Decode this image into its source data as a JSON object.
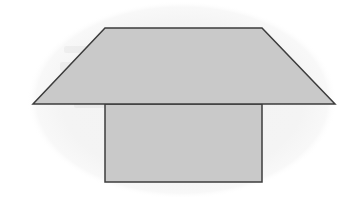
{
  "image": {
    "width": 353,
    "height": 197,
    "background_color": "#ffffff",
    "description": "Scanned line drawing of a solid: an isosceles trapezoid sitting on top of a rectangle, over a faint oval page-shadow tint"
  },
  "figure": {
    "stroke_color": "#3c3c3c",
    "stroke_width": 1.5,
    "fill_color": "#c9c9c9",
    "backdrop": {
      "name": "oval-page-tint",
      "shape": "ellipse",
      "fill_color": "#f4f4f4",
      "center_x": 182,
      "center_y": 100,
      "radius_x": 155,
      "radius_y": 99
    },
    "shapes": [
      {
        "name": "trapezoid",
        "type": "polygon",
        "fill_color": "#c9c9c9",
        "points": "105,28 262,28 335,104 33,104",
        "vertices": [
          {
            "label": "top-left",
            "x": 105,
            "y": 28
          },
          {
            "label": "top-right",
            "x": 262,
            "y": 28
          },
          {
            "label": "bottom-right",
            "x": 335,
            "y": 104
          },
          {
            "label": "bottom-left",
            "x": 33,
            "y": 104
          }
        ]
      },
      {
        "name": "rectangle",
        "type": "rect",
        "fill_color": "#c9c9c9",
        "x": 105,
        "y": 104,
        "width": 157,
        "height": 78,
        "vertices": [
          {
            "label": "top-left",
            "x": 105,
            "y": 104
          },
          {
            "label": "top-right",
            "x": 262,
            "y": 104
          },
          {
            "label": "bottom-right",
            "x": 262,
            "y": 182
          },
          {
            "label": "bottom-left",
            "x": 105,
            "y": 182
          }
        ]
      }
    ],
    "ghost_text": {
      "name": "scanner-bleed-through",
      "legible": false,
      "opacity": 0.05,
      "note": "Illegible mirrored text showing through from the reverse side of the scanned page"
    }
  }
}
